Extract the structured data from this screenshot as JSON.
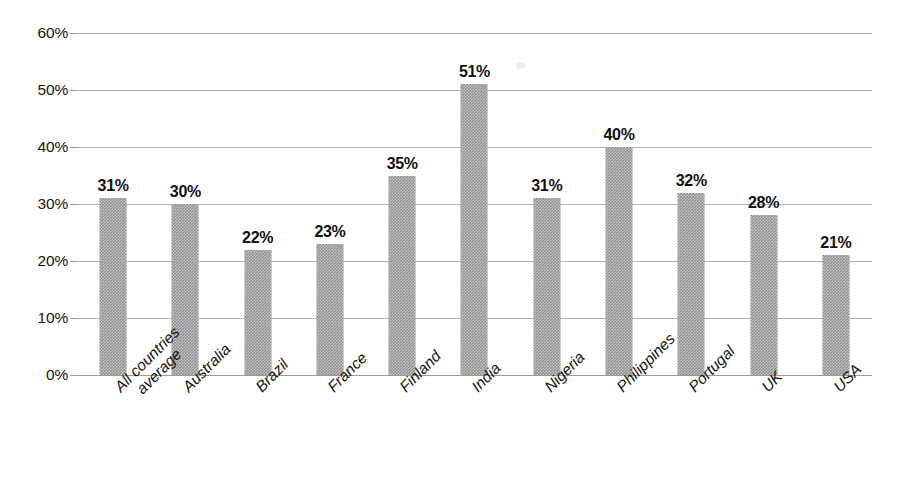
{
  "chart_data": {
    "type": "bar",
    "title": "",
    "subtitle": "",
    "xlabel": "",
    "ylabel": "",
    "ylim": [
      0,
      60
    ],
    "ytick_step": 10,
    "grid": true,
    "legend": false,
    "value_suffix": "%",
    "orientation": "vertical",
    "bar_color": "#8e8e8e",
    "gridline_color": "#b3b3b3",
    "axis_color": "#9a9a9a",
    "label_color": "#111111",
    "categories": [
      "All countries average",
      "Australia",
      "Brazil",
      "France",
      "Finland",
      "India",
      "Nigeria",
      "Philippines",
      "Portugal",
      "UK",
      "USA"
    ],
    "category_lines": [
      [
        "All countries",
        "average"
      ],
      [
        "Australia"
      ],
      [
        "Brazil"
      ],
      [
        "France"
      ],
      [
        "Finland"
      ],
      [
        "India"
      ],
      [
        "Nigeria"
      ],
      [
        "Philippines"
      ],
      [
        "Portugal"
      ],
      [
        "UK"
      ],
      [
        "USA"
      ]
    ],
    "values": [
      31,
      30,
      22,
      23,
      35,
      51,
      31,
      40,
      32,
      28,
      21
    ],
    "value_labels": [
      "31%",
      "30%",
      "22%",
      "23%",
      "35%",
      "51%",
      "31%",
      "40%",
      "32%",
      "28%",
      "21%"
    ],
    "ytick_labels": [
      "60%",
      "50%",
      "40%",
      "30%",
      "20%",
      "10%",
      "0%"
    ],
    "ytick_values": [
      60,
      50,
      40,
      30,
      20,
      10,
      0
    ]
  }
}
